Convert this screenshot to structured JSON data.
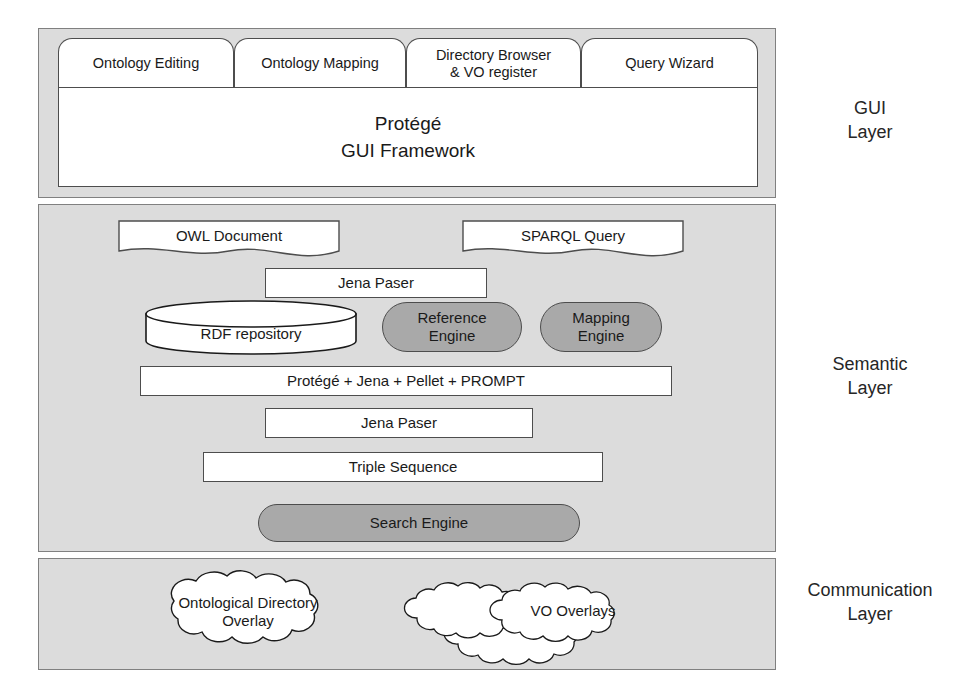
{
  "layers": [
    {
      "id": "gui",
      "caption": "GUI\nLayer"
    },
    {
      "id": "semantic",
      "caption": "Semantic\nLayer"
    },
    {
      "id": "communication",
      "caption": "Communication\nLayer"
    }
  ],
  "gui_layer": {
    "tabs": [
      {
        "label": "Ontology Editing",
        "active": true
      },
      {
        "label": "Ontology Mapping",
        "active": false
      },
      {
        "label": "Directory Browser\n& VO register",
        "active": false
      },
      {
        "label": "Query Wizard",
        "active": false
      }
    ],
    "framework_label": "Protégé\nGUI Framework"
  },
  "semantic_layer": {
    "owl_document": "OWL Document",
    "sparql_query": "SPARQL Query",
    "jena_parser_top": "Jena Paser",
    "rdf_repository": "RDF repository",
    "reference_engine": "Reference\nEngine",
    "mapping_engine": "Mapping\nEngine",
    "protege_stack": "Protégé + Jena + Pellet + PROMPT",
    "jena_parser_bottom": "Jena Paser",
    "triple_sequence": "Triple Sequence",
    "search_engine": "Search Engine"
  },
  "communication_layer": {
    "ontological_directory_overlay": "Ontological Directory\nOverlay",
    "vo_overlays": "VO Overlays"
  },
  "colors": {
    "panel_fill": "#dcdcdc",
    "node_fill": "#ffffff",
    "engine_fill": "#a9a9a9",
    "outline": "#4d4d4d",
    "text": "#1a1a1a"
  }
}
